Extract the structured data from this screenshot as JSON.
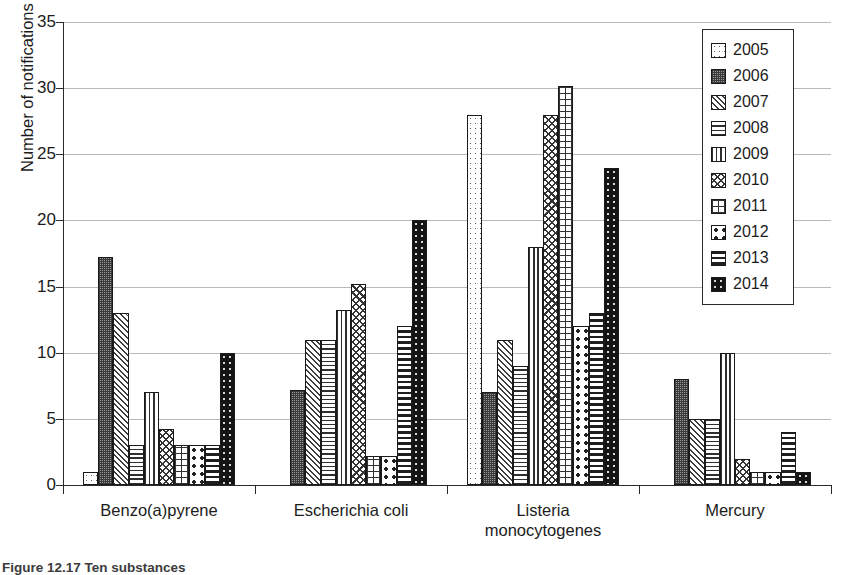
{
  "chart_data": {
    "type": "bar",
    "title": "",
    "xlabel": "",
    "ylabel": "Number of notifications",
    "ylim": [
      0,
      35
    ],
    "yticks": [
      0,
      5,
      10,
      15,
      20,
      25,
      30,
      35
    ],
    "grid": true,
    "legend_position": "top-right",
    "categories": [
      "Benzo(a)pyrene",
      "Escherichia coli",
      "Listeria monocytogenes",
      "Mercury"
    ],
    "category_lines": [
      [
        "Benzo(a)pyrene"
      ],
      [
        "Escherichia coli"
      ],
      [
        "Listeria",
        "monocytogenes"
      ],
      [
        "Mercury"
      ]
    ],
    "series": [
      {
        "name": "2005",
        "pattern": "sparse-dots",
        "values": [
          1,
          0,
          28,
          0
        ]
      },
      {
        "name": "2006",
        "pattern": "dense-checker",
        "values": [
          17.2,
          7.2,
          7,
          8
        ]
      },
      {
        "name": "2007",
        "pattern": "diagonal-hatch",
        "values": [
          13,
          11,
          11,
          5
        ]
      },
      {
        "name": "2008",
        "pattern": "horizontal-lines",
        "values": [
          3,
          11,
          9,
          5
        ]
      },
      {
        "name": "2009",
        "pattern": "vertical-lines",
        "values": [
          7,
          13.2,
          18,
          10
        ]
      },
      {
        "name": "2010",
        "pattern": "zigzag",
        "values": [
          4.2,
          15.2,
          28,
          2
        ]
      },
      {
        "name": "2011",
        "pattern": "grid",
        "values": [
          3,
          2.2,
          30.2,
          1
        ]
      },
      {
        "name": "2012",
        "pattern": "large-dots",
        "values": [
          3,
          2.2,
          12,
          1
        ]
      },
      {
        "name": "2013",
        "pattern": "thick-bands",
        "values": [
          3,
          12,
          13,
          4
        ]
      },
      {
        "name": "2014",
        "pattern": "solid-black",
        "values": [
          10,
          20,
          24,
          1
        ]
      }
    ]
  },
  "legend": {
    "entries": [
      {
        "label": "2005"
      },
      {
        "label": "2006"
      },
      {
        "label": "2007"
      },
      {
        "label": "2008"
      },
      {
        "label": "2009"
      },
      {
        "label": "2010"
      },
      {
        "label": "2011"
      },
      {
        "label": "2012"
      },
      {
        "label": "2013"
      },
      {
        "label": "2014"
      }
    ]
  },
  "caption": {
    "text": "Figure 12.17 Ten substances"
  },
  "colors": {
    "axis": "#2b2b2b",
    "grid": "#b9b9b9",
    "text": "#1c1c1c",
    "bar_outline": "#1a1a1a",
    "background": "#ffffff"
  }
}
